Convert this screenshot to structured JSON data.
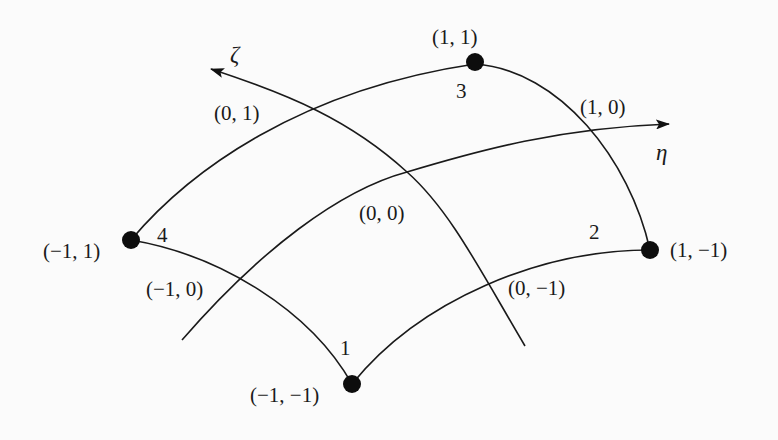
{
  "diagram": {
    "type": "curvilinear quadrilateral element in natural coordinates",
    "axes": [
      {
        "id": "zeta",
        "label": "ζ"
      },
      {
        "id": "eta",
        "label": "η"
      }
    ],
    "nodes": [
      {
        "id": "1",
        "number_label": "1",
        "coord_label": "(−1, −1)"
      },
      {
        "id": "2",
        "number_label": "2",
        "coord_label": "(1, −1)"
      },
      {
        "id": "3",
        "number_label": "3",
        "coord_label": "(1, 1)"
      },
      {
        "id": "4",
        "number_label": "4",
        "coord_label": "(−1, 1)"
      }
    ],
    "midpoints": [
      {
        "id": "m01",
        "coord_label": "(0, 1)"
      },
      {
        "id": "m10",
        "coord_label": "(1, 0)"
      },
      {
        "id": "m00",
        "coord_label": "(0, 0)"
      },
      {
        "id": "m-10",
        "coord_label": "(−1, 0)"
      },
      {
        "id": "m0-1",
        "coord_label": "(0, −1)"
      }
    ]
  }
}
